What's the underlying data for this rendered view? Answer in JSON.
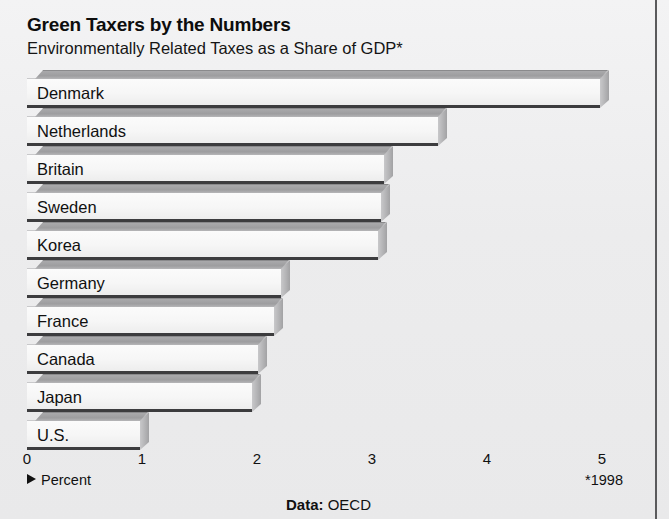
{
  "chart_data": {
    "type": "bar",
    "orientation": "horizontal",
    "title": "Green Taxers by the Numbers",
    "subtitle": "Environmentally Related Taxes as a Share of GDP*",
    "categories": [
      "Denmark",
      "Netherlands",
      "Britain",
      "Sweden",
      "Korea",
      "Germany",
      "France",
      "Canada",
      "Japan",
      "U.S."
    ],
    "values": [
      4.98,
      3.57,
      3.1,
      3.08,
      3.05,
      2.21,
      2.15,
      2.01,
      1.96,
      0.98
    ],
    "xlabel": "Percent",
    "ylabel": "",
    "xlim": [
      0,
      5
    ],
    "tick_labels": [
      "0",
      "1",
      "2",
      "3",
      "4",
      "5"
    ],
    "tick_values": [
      0,
      1,
      2,
      3,
      4,
      5
    ],
    "grid": false,
    "legend": "none",
    "footnote": "*1998",
    "source_label": "Data:",
    "source_value": "OECD",
    "axis_note": "Percent",
    "style": "3d-horizontal-bars-grayscale"
  },
  "colors": {
    "background": "#ececed",
    "bar_front": "#f8f8f8",
    "bar_top": "#a0a0a2",
    "bar_side": "#b4b4b6",
    "bar_baseline": "#3c3c3e",
    "text": "#111111",
    "frame_border": "#5a5a5c"
  }
}
